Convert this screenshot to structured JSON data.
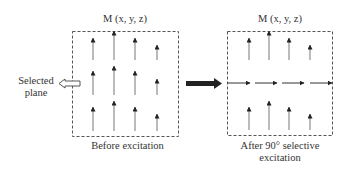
{
  "left_panel": {
    "title": "M (x, y, z)",
    "caption": "Before excitation",
    "side_label_line1": "Selected",
    "side_label_line2": "plane"
  },
  "right_panel": {
    "title": "M (x, y, z)",
    "caption_line1": "After 90° selective",
    "caption_line2": "excitation"
  },
  "colors": {
    "arrow": "#222222",
    "arrow_shaft": "#777777",
    "box_border": "#555555"
  }
}
